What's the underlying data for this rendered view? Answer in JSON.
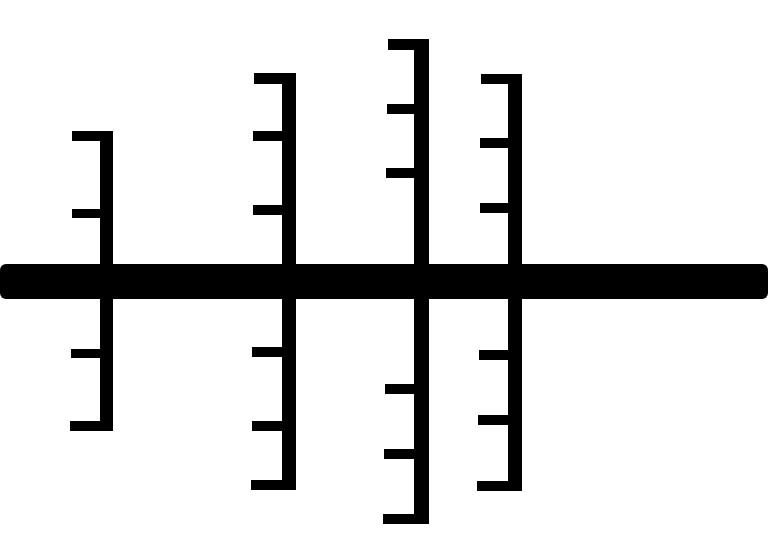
{
  "diagram": {
    "background": "#ffffff",
    "stroke_color": "#000000",
    "spine": {
      "x": 0,
      "y": 264,
      "width": 768,
      "height": 35
    },
    "branches": [
      {
        "name": "branch-1",
        "vertical": {
          "x": 100,
          "y": 131,
          "width": 13,
          "height": 300
        },
        "ticks": [
          {
            "x": 72,
            "y": 131,
            "width": 41,
            "height": 10
          },
          {
            "x": 72,
            "y": 209,
            "width": 30,
            "height": 9
          },
          {
            "x": 71,
            "y": 349,
            "width": 31,
            "height": 9
          },
          {
            "x": 70,
            "y": 421,
            "width": 42,
            "height": 10
          }
        ]
      },
      {
        "name": "branch-2",
        "vertical": {
          "x": 282,
          "y": 73,
          "width": 14,
          "height": 417
        },
        "ticks": [
          {
            "x": 254,
            "y": 73,
            "width": 42,
            "height": 11
          },
          {
            "x": 253,
            "y": 131,
            "width": 31,
            "height": 10
          },
          {
            "x": 253,
            "y": 205,
            "width": 31,
            "height": 10
          },
          {
            "x": 252,
            "y": 347,
            "width": 32,
            "height": 10
          },
          {
            "x": 252,
            "y": 421,
            "width": 32,
            "height": 10
          },
          {
            "x": 251,
            "y": 480,
            "width": 44,
            "height": 10
          }
        ]
      },
      {
        "name": "branch-3",
        "vertical": {
          "x": 414,
          "y": 39,
          "width": 15,
          "height": 485
        },
        "ticks": [
          {
            "x": 388,
            "y": 39,
            "width": 41,
            "height": 11
          },
          {
            "x": 387,
            "y": 104,
            "width": 29,
            "height": 10
          },
          {
            "x": 386,
            "y": 168,
            "width": 30,
            "height": 10
          },
          {
            "x": 385,
            "y": 384,
            "width": 30,
            "height": 10
          },
          {
            "x": 384,
            "y": 449,
            "width": 31,
            "height": 10
          },
          {
            "x": 383,
            "y": 514,
            "width": 44,
            "height": 10
          }
        ]
      },
      {
        "name": "branch-4",
        "vertical": {
          "x": 508,
          "y": 74,
          "width": 14,
          "height": 417
        },
        "ticks": [
          {
            "x": 481,
            "y": 74,
            "width": 41,
            "height": 10
          },
          {
            "x": 480,
            "y": 138,
            "width": 30,
            "height": 10
          },
          {
            "x": 480,
            "y": 203,
            "width": 30,
            "height": 10
          },
          {
            "x": 479,
            "y": 350,
            "width": 30,
            "height": 10
          },
          {
            "x": 478,
            "y": 415,
            "width": 31,
            "height": 10
          },
          {
            "x": 477,
            "y": 481,
            "width": 44,
            "height": 10
          }
        ]
      }
    ]
  }
}
